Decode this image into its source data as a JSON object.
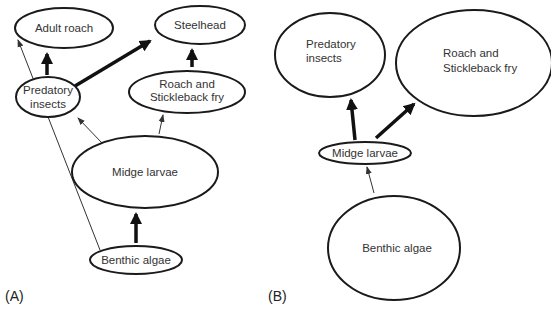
{
  "panels": {
    "a": {
      "label": "(A)",
      "nodes": {
        "adult_roach": "Adult roach",
        "steelhead": "Steelhead",
        "predatory_insects_1": "Predatory",
        "predatory_insects_2": "insects",
        "roach_fry_1": "Roach and",
        "roach_fry_2": "Stickleback fry",
        "midge_larvae": "Midge larvae",
        "benthic_algae": "Benthic algae"
      },
      "edges": [
        {
          "from": "Benthic algae",
          "to": "Midge larvae",
          "weight": "strong"
        },
        {
          "from": "Benthic algae",
          "to": "Adult roach",
          "weight": "weak"
        },
        {
          "from": "Midge larvae",
          "to": "Predatory insects",
          "weight": "weak"
        },
        {
          "from": "Midge larvae",
          "to": "Roach and Stickleback fry",
          "weight": "weak"
        },
        {
          "from": "Predatory insects",
          "to": "Adult roach",
          "weight": "strong"
        },
        {
          "from": "Predatory insects",
          "to": "Steelhead",
          "weight": "strong"
        },
        {
          "from": "Roach and Stickleback fry",
          "to": "Steelhead",
          "weight": "strong"
        }
      ]
    },
    "b": {
      "label": "(B)",
      "nodes": {
        "predatory_insects_1": "Predatory",
        "predatory_insects_2": "insects",
        "roach_fry_1": "Roach and",
        "roach_fry_2": "Stickleback fry",
        "midge_larvae": "Midge larvae",
        "benthic_algae": "Benthic algae"
      },
      "edges": [
        {
          "from": "Benthic algae",
          "to": "Midge larvae",
          "weight": "weak"
        },
        {
          "from": "Midge larvae",
          "to": "Predatory insects",
          "weight": "strong"
        },
        {
          "from": "Midge larvae",
          "to": "Roach and Stickleback fry",
          "weight": "strong"
        }
      ]
    }
  }
}
